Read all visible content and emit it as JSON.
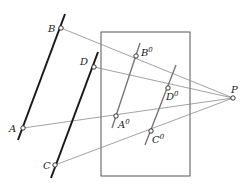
{
  "diagram": {
    "type": "perspective-projection",
    "colors": {
      "background": "#ffffff",
      "thick_line": "#1a1a1a",
      "projection_ray": "#8a8a8a",
      "frame": "#555555",
      "image_line": "#777777"
    },
    "frame": {
      "x": 101,
      "y": 32,
      "width": 89,
      "height": 144
    },
    "center": {
      "label": "P",
      "x": 233,
      "y": 98
    },
    "object_lines": [
      {
        "name": "line-AB",
        "x1": 65,
        "y1": 14,
        "x2": 18,
        "y2": 140
      },
      {
        "name": "line-CD",
        "x1": 98,
        "y1": 52,
        "x2": 51,
        "y2": 178
      }
    ],
    "image_lines": [
      {
        "name": "line-A0B0",
        "x1": 140,
        "y1": 43,
        "x2": 112,
        "y2": 128
      },
      {
        "name": "line-C0D0",
        "x1": 176,
        "y1": 65,
        "x2": 145,
        "y2": 145
      }
    ],
    "points": [
      {
        "label": "A",
        "x": 23,
        "y": 128,
        "lx": 9,
        "ly": 132
      },
      {
        "label": "B",
        "x": 61,
        "y": 28,
        "lx": 48,
        "ly": 32
      },
      {
        "label": "C",
        "x": 55,
        "y": 165,
        "lx": 43,
        "ly": 169
      },
      {
        "label": "D",
        "x": 94,
        "y": 67,
        "lx": 80,
        "ly": 65
      }
    ],
    "image_points": [
      {
        "label": "A",
        "sup": "0",
        "x": 116,
        "y": 116,
        "lx": 118,
        "ly": 128
      },
      {
        "label": "B",
        "sup": "0",
        "x": 136,
        "y": 56,
        "lx": 141,
        "ly": 56
      },
      {
        "label": "C",
        "sup": "0",
        "x": 151,
        "y": 131,
        "lx": 152,
        "ly": 143
      },
      {
        "label": "D",
        "sup": "0",
        "x": 168,
        "y": 88,
        "lx": 166,
        "ly": 100
      }
    ]
  }
}
